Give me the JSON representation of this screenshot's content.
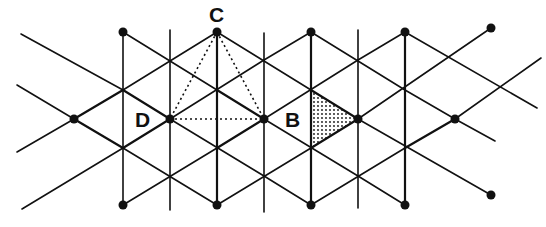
{
  "diagram": {
    "labels": [
      {
        "id": "C",
        "text": "C"
      },
      {
        "id": "D",
        "text": "D"
      },
      {
        "id": "B",
        "text": "B"
      }
    ],
    "colors": {
      "line": "#111111",
      "background": "#ffffff"
    },
    "vertical_lines_x": [
      123,
      170,
      217,
      264,
      311,
      358,
      405
    ],
    "nodes": {
      "top": [
        [
          123,
          32
        ],
        [
          217,
          32
        ],
        [
          311,
          32
        ],
        [
          405,
          32
        ],
        [
          491,
          28
        ]
      ],
      "middle": [
        [
          74,
          119
        ],
        [
          170,
          119
        ],
        [
          264,
          119
        ],
        [
          358,
          119
        ],
        [
          455,
          119
        ]
      ],
      "bottom": [
        [
          123,
          205
        ],
        [
          217,
          205
        ],
        [
          311,
          205
        ],
        [
          405,
          205
        ],
        [
          491,
          195
        ]
      ]
    },
    "dotted_triangle": [
      [
        217,
        32
      ],
      [
        170,
        119
      ],
      [
        264,
        119
      ]
    ],
    "shaded_triangle": [
      [
        311,
        90
      ],
      [
        311,
        148
      ],
      [
        358,
        119
      ]
    ]
  }
}
